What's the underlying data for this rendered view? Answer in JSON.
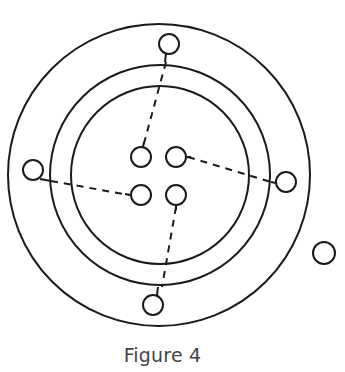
{
  "caption": "Figure 4",
  "colors": {
    "stroke": "#1a1a1a",
    "caption": "#444444",
    "background": "#ffffff"
  },
  "rings": [
    {
      "name": "outer-ring",
      "cx": 159,
      "cy": 175,
      "r": 151
    },
    {
      "name": "middle-ring",
      "cx": 160,
      "cy": 175,
      "r": 110
    },
    {
      "name": "inner-ring",
      "cx": 160,
      "cy": 175,
      "r": 89
    }
  ],
  "nucleus_particles": [
    {
      "name": "nucleus-particle-top-left",
      "cx": 141,
      "cy": 157,
      "r": 10
    },
    {
      "name": "nucleus-particle-top-right",
      "cx": 176,
      "cy": 157,
      "r": 10
    },
    {
      "name": "nucleus-particle-bottom-left",
      "cx": 141,
      "cy": 195,
      "r": 10
    },
    {
      "name": "nucleus-particle-bottom-right",
      "cx": 176,
      "cy": 195,
      "r": 10
    }
  ],
  "shell_particles": [
    {
      "name": "shell-particle-top",
      "cx": 169,
      "cy": 44,
      "r": 10
    },
    {
      "name": "shell-particle-left",
      "cx": 33,
      "cy": 170,
      "r": 10
    },
    {
      "name": "shell-particle-right",
      "cx": 286,
      "cy": 182,
      "r": 10
    },
    {
      "name": "shell-particle-bottom",
      "cx": 153,
      "cy": 305,
      "r": 10
    }
  ],
  "free_particle": {
    "name": "free-particle",
    "cx": 324,
    "cy": 253,
    "r": 11
  },
  "dashed_links": [
    {
      "name": "link-top",
      "x1": 166,
      "y1": 62,
      "x2": 143,
      "y2": 147
    },
    {
      "name": "link-left",
      "x1": 51,
      "y1": 181,
      "x2": 129,
      "y2": 195
    },
    {
      "name": "link-right",
      "x1": 188,
      "y1": 157,
      "x2": 271,
      "y2": 182
    },
    {
      "name": "link-bottom",
      "x1": 176,
      "y1": 207,
      "x2": 162,
      "y2": 287
    }
  ],
  "solid_stubs": [
    {
      "name": "stub-top",
      "x1": 166,
      "y1": 54,
      "x2": 165,
      "y2": 62
    },
    {
      "name": "stub-left",
      "x1": 40,
      "y1": 179,
      "x2": 51,
      "y2": 181
    },
    {
      "name": "stub-right",
      "x1": 271,
      "y1": 182,
      "x2": 276,
      "y2": 183
    },
    {
      "name": "stub-bottom",
      "x1": 157,
      "y1": 295,
      "x2": 158,
      "y2": 287
    },
    {
      "name": "stub-nucleus-top-left",
      "x1": 143,
      "y1": 147,
      "x2": 144,
      "y2": 142
    },
    {
      "name": "stub-nucleus-top-right",
      "x1": 186,
      "y1": 157,
      "x2": 191,
      "y2": 157
    },
    {
      "name": "stub-nucleus-bottom-left",
      "x1": 125,
      "y1": 194,
      "x2": 131,
      "y2": 195
    },
    {
      "name": "stub-nucleus-bottom-right",
      "x1": 176,
      "y1": 205,
      "x2": 176,
      "y2": 210
    }
  ]
}
